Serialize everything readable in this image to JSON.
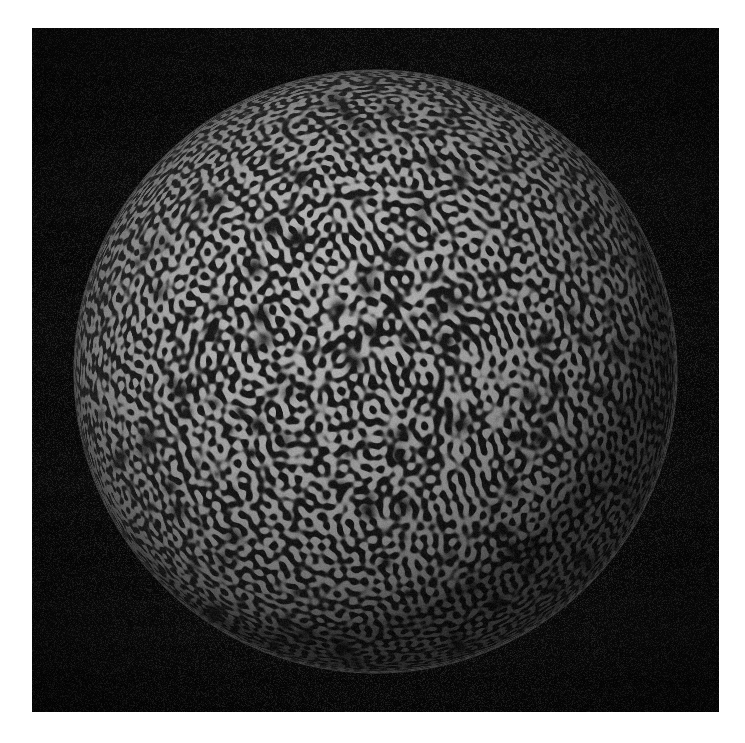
{
  "figure": {
    "kind": "scientific-visualization",
    "title": "",
    "caption": "",
    "background_color": "#ffffff",
    "plate_color": "#060606",
    "pattern_light_color": "#b9b9b9",
    "pattern_dark_color": "#1a1a1a",
    "rim_color": "#8f8f8f"
  },
  "plate": {
    "name": "black-plate",
    "x": 32,
    "y": 28,
    "width": 687,
    "height": 684,
    "noise_amplitude": 10
  },
  "sphere": {
    "name": "patterned-sphere",
    "center_x": 375,
    "center_y": 371,
    "radius": 302,
    "wavelength_px": 11,
    "defect_count": 170,
    "limb_darkening": 0.55,
    "light_direction": "top-left",
    "edge_compression": "strong"
  },
  "chart_data": {
    "type": "heatmap",
    "title": "Turing pattern on a spherical surface",
    "xlabel": "",
    "ylabel": "",
    "projection": "orthographic",
    "colormap": "grayscale",
    "value_range": [
      0,
      1
    ],
    "grid": false,
    "legend": "none",
    "series": [
      {
        "name": "surface-concentration",
        "units": "normalized activator concentration",
        "min": 0.0,
        "max": 1.0
      }
    ]
  }
}
